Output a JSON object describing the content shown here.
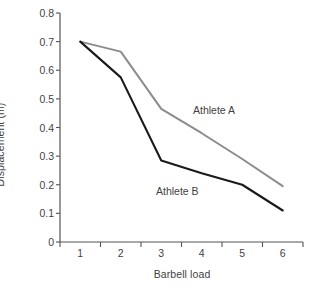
{
  "chart_data": {
    "type": "line",
    "title": "",
    "subtitle": "",
    "xlabel": "Barbell load",
    "ylabel": "Displacement (m)",
    "categories": [
      "1",
      "2",
      "3",
      "4",
      "5",
      "6"
    ],
    "x": [
      1,
      2,
      3,
      4,
      5,
      6
    ],
    "xlim": [
      0.5,
      6.5
    ],
    "ylim": [
      0,
      0.8
    ],
    "yticks": [
      "0",
      "0.1",
      "0.2",
      "0.3",
      "0.4",
      "0.5",
      "0.6",
      "0.7",
      "0.8"
    ],
    "ytick_values": [
      0,
      0.1,
      0.2,
      0.3,
      0.4,
      0.5,
      0.6,
      0.7,
      0.8
    ],
    "grid": false,
    "legend": "inline-annotations",
    "series": [
      {
        "name": "Athlete A",
        "color": "#8c8c8c",
        "values": [
          0.7,
          0.665,
          0.465,
          0.38,
          0.29,
          0.195
        ]
      },
      {
        "name": "Athlete B",
        "color": "#1a1a1a",
        "values": [
          0.7,
          0.575,
          0.285,
          0.24,
          0.2,
          0.11
        ]
      }
    ],
    "annotations": [
      {
        "text": "Athlete A",
        "series": "Athlete A"
      },
      {
        "text": "Athlete B",
        "series": "Athlete B"
      }
    ],
    "axis_color": "#555555",
    "background": "#ffffff"
  }
}
